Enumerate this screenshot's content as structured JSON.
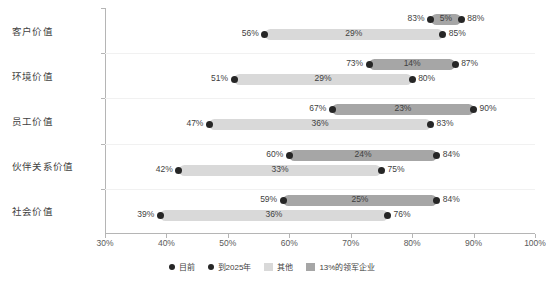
{
  "chart_data": {
    "type": "bar",
    "subtype": "dumbbell-range",
    "title": "",
    "xlabel": "",
    "ylabel": "",
    "xlim": [
      30,
      100
    ],
    "xtick_labels": [
      "30%",
      "40%",
      "50%",
      "60%",
      "70%",
      "80%",
      "90%",
      "100%"
    ],
    "xticks": [
      30,
      40,
      50,
      60,
      70,
      80,
      90,
      100
    ],
    "grid": false,
    "legend_position": "bottom",
    "categories": [
      "客户价值",
      "环境价值",
      "员工价值",
      "伙伴关系价值",
      "社会价值"
    ],
    "series": [
      {
        "name": "13%的领军企业",
        "color": "#a6a6a6",
        "start_label": "目前",
        "end_label": "到2025年",
        "start": [
          83,
          73,
          67,
          60,
          59
        ],
        "end": [
          88,
          87,
          90,
          84,
          84
        ],
        "delta": [
          5,
          14,
          23,
          24,
          25
        ]
      },
      {
        "name": "其他",
        "color": "#d9d9d9",
        "start_label": "目前",
        "end_label": "到2025年",
        "start": [
          56,
          51,
          47,
          42,
          39
        ],
        "end": [
          85,
          80,
          83,
          75,
          76
        ],
        "delta": [
          29,
          29,
          36,
          33,
          36
        ]
      }
    ],
    "rows": [
      {
        "category": "客户价值",
        "leader": {
          "start": 83,
          "end": 88,
          "delta": 5,
          "start_text": "83%",
          "end_text": "88%",
          "delta_text": "5%"
        },
        "other": {
          "start": 56,
          "end": 85,
          "delta": 29,
          "start_text": "56%",
          "end_text": "85%",
          "delta_text": "29%"
        }
      },
      {
        "category": "环境价值",
        "leader": {
          "start": 73,
          "end": 87,
          "delta": 14,
          "start_text": "73%",
          "end_text": "87%",
          "delta_text": "14%"
        },
        "other": {
          "start": 51,
          "end": 80,
          "delta": 29,
          "start_text": "51%",
          "end_text": "80%",
          "delta_text": "29%"
        }
      },
      {
        "category": "员工价值",
        "leader": {
          "start": 67,
          "end": 90,
          "delta": 23,
          "start_text": "67%",
          "end_text": "90%",
          "delta_text": "23%"
        },
        "other": {
          "start": 47,
          "end": 83,
          "delta": 36,
          "start_text": "47%",
          "end_text": "83%",
          "delta_text": "36%"
        }
      },
      {
        "category": "伙伴关系价值",
        "leader": {
          "start": 60,
          "end": 84,
          "delta": 24,
          "start_text": "60%",
          "end_text": "84%",
          "delta_text": "24%"
        },
        "other": {
          "start": 42,
          "end": 75,
          "delta": 33,
          "start_text": "42%",
          "end_text": "75%",
          "delta_text": "33%"
        }
      },
      {
        "category": "社会价值",
        "leader": {
          "start": 59,
          "end": 84,
          "delta": 25,
          "start_text": "59%",
          "end_text": "84%",
          "delta_text": "25%"
        },
        "other": {
          "start": 39,
          "end": 76,
          "delta": 36,
          "start_text": "39%",
          "end_text": "76%",
          "delta_text": "36%"
        }
      }
    ],
    "legend": [
      {
        "label": "目前",
        "marker": "dot",
        "color": "#262626"
      },
      {
        "label": "到2025年",
        "marker": "dot",
        "color": "#262626"
      },
      {
        "label": "其他",
        "marker": "box",
        "color": "#d9d9d9"
      },
      {
        "label": "13%的领军企业",
        "marker": "box",
        "color": "#a6a6a6"
      }
    ],
    "colors": {
      "leader_bar": "#a6a6a6",
      "other_bar": "#d9d9d9",
      "dot": "#262626",
      "axis": "#b5b5b5",
      "text": "#3f3f3f",
      "background": "#ffffff"
    }
  }
}
